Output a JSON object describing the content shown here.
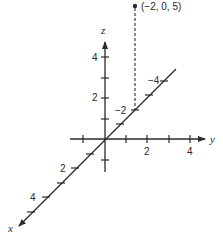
{
  "diagram": {
    "type": "3d-coordinate-axes",
    "axes": {
      "x": {
        "label": "x",
        "tick_labels": [
          "2",
          "4"
        ]
      },
      "y": {
        "label": "y",
        "tick_labels": [
          "2",
          "4"
        ]
      },
      "z": {
        "label": "z",
        "tick_labels": [
          "2",
          "4"
        ]
      },
      "x_negative_tick_labels": [
        "−2",
        "−4"
      ]
    },
    "point": {
      "label": "(−2, 0, 5)",
      "coords": [
        -2,
        0,
        5
      ]
    },
    "colors": {
      "ink": "#2a2a2a",
      "background": "#ffffff"
    }
  }
}
